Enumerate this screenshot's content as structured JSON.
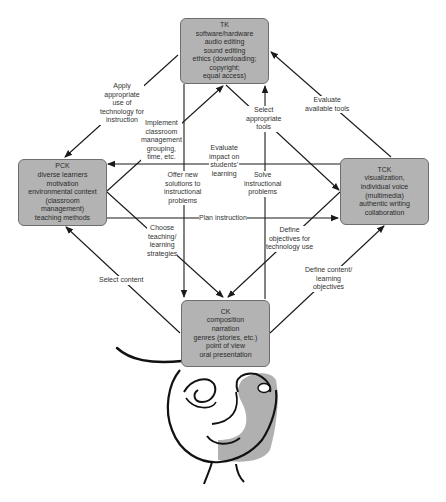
{
  "nodes": {
    "tk": {
      "title": "TK",
      "lines": [
        "software/hardware",
        "audio editing",
        "sound editing",
        "ethics (downloading;",
        "copyright;",
        "equal access)"
      ]
    },
    "pck": {
      "title": "PCK",
      "lines": [
        "diverse learners",
        "motivation",
        "environmental context",
        "(classroom",
        "management)",
        "teaching methods"
      ]
    },
    "tck": {
      "title": "TCK",
      "lines": [
        "visualization,",
        "individual voice",
        "(multimedia)",
        "authentic writing",
        "collaboration"
      ]
    },
    "ck": {
      "title": "CK",
      "lines": [
        "composition",
        "narration",
        "genres (stories, etc.)",
        "point of view",
        "oral presentation"
      ]
    }
  },
  "edges": {
    "apply": {
      "lines": [
        "Apply",
        "appropriate",
        "use of",
        "technology for",
        "instruction"
      ]
    },
    "implement": {
      "lines": [
        "Implement",
        "classroom",
        "management",
        "grouping,",
        "time, etc."
      ]
    },
    "select_tools": {
      "lines": [
        "Select",
        "appropriate",
        "tools"
      ]
    },
    "evaluate_tools": {
      "lines": [
        "Evaluate",
        "available tools"
      ]
    },
    "evaluate_impact": {
      "lines": [
        "Evaluate",
        "impact on",
        "students'",
        "learning"
      ]
    },
    "offer": {
      "lines": [
        "Offer new",
        "solutions to",
        "instructional",
        "problems"
      ]
    },
    "solve": {
      "lines": [
        "Solve",
        "instructional",
        "problems"
      ]
    },
    "plan": {
      "lines": [
        "Plan instruction"
      ]
    },
    "choose": {
      "lines": [
        "Choose",
        "teaching/",
        "learning",
        "strategies"
      ]
    },
    "define_tech": {
      "lines": [
        "Define",
        "objectives for",
        "technology use"
      ]
    },
    "select_content": {
      "lines": [
        "Select content"
      ]
    },
    "define_content": {
      "lines": [
        "Define content/",
        "learning",
        "objectives"
      ]
    }
  },
  "colors": {
    "box_fill": "#b3b3b3",
    "box_border": "#6e6e6e",
    "line": "#1a1a1a",
    "face_shade": "#b0b0b0"
  }
}
